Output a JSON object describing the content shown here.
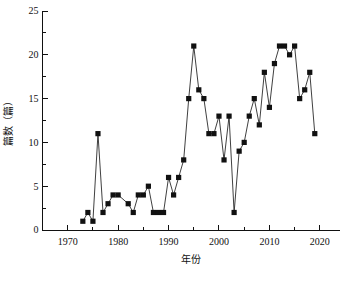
{
  "chart_data": {
    "type": "line",
    "title": "",
    "subtitle": "",
    "xlabel": "年份",
    "ylabel": "篇数（篇）",
    "xlim": [
      1965,
      2024
    ],
    "ylim": [
      0,
      25
    ],
    "xticks": [
      1970,
      1980,
      1990,
      2000,
      2010,
      2020
    ],
    "xtick_labels": [
      "1970",
      "1980",
      "1990",
      "2000",
      "2010",
      "2020"
    ],
    "xminor_ticks": [
      1965,
      1975,
      1985,
      1995,
      2005,
      2015
    ],
    "yticks": [
      0,
      5,
      10,
      15,
      20,
      25
    ],
    "ytick_labels": [
      "0",
      "5",
      "10",
      "15",
      "20",
      "25"
    ],
    "yminor_ticks": [
      2.5,
      7.5,
      12.5,
      17.5,
      22.5
    ],
    "grid": false,
    "legend": false,
    "legend_position": "none",
    "marker": "square",
    "marker_color": "#111111",
    "line_color": "#2a2a2a",
    "x": [
      1973,
      1974,
      1975,
      1976,
      1977,
      1978,
      1979,
      1980,
      1982,
      1983,
      1984,
      1985,
      1986,
      1987,
      1988,
      1989,
      1990,
      1991,
      1992,
      1993,
      1994,
      1995,
      1996,
      1997,
      1998,
      1999,
      2000,
      2001,
      2002,
      2003,
      2004,
      2005,
      2006,
      2007,
      2008,
      2009,
      2010,
      2011,
      2012,
      2013,
      2014,
      2015,
      2016,
      2017,
      2018,
      2019
    ],
    "values": [
      1,
      2,
      1,
      11,
      2,
      3,
      4,
      4,
      3,
      2,
      4,
      4,
      5,
      2,
      2,
      2,
      6,
      4,
      6,
      8,
      15,
      21,
      16,
      15,
      11,
      11,
      13,
      8,
      13,
      2,
      9,
      10,
      13,
      15,
      12,
      18,
      14,
      19,
      21,
      21,
      20,
      21,
      15,
      16,
      18,
      11
    ],
    "series": [
      {
        "name": "篇数",
        "values": [
          1,
          2,
          1,
          11,
          2,
          3,
          4,
          4,
          3,
          2,
          4,
          4,
          5,
          2,
          2,
          2,
          6,
          4,
          6,
          8,
          15,
          21,
          16,
          15,
          11,
          11,
          13,
          8,
          13,
          2,
          9,
          10,
          13,
          15,
          12,
          18,
          14,
          19,
          21,
          21,
          20,
          21,
          15,
          16,
          18,
          11
        ]
      }
    ]
  }
}
